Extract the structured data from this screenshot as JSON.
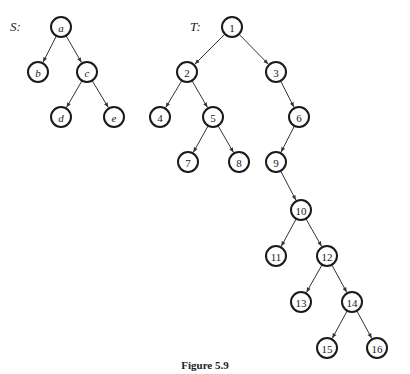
{
  "caption": "Figure 5.9",
  "trees": [
    {
      "id": "S",
      "label": "S:",
      "italic_nodes": true,
      "nodes": [
        "a",
        "b",
        "c",
        "d",
        "e"
      ],
      "edges": [
        [
          "a",
          "b"
        ],
        [
          "a",
          "c"
        ],
        [
          "c",
          "d"
        ],
        [
          "c",
          "e"
        ]
      ]
    },
    {
      "id": "T",
      "label": "T:",
      "italic_nodes": false,
      "nodes": [
        "1",
        "2",
        "3",
        "4",
        "5",
        "6",
        "7",
        "8",
        "9",
        "10",
        "11",
        "12",
        "13",
        "14",
        "15",
        "16"
      ],
      "edges": [
        [
          "1",
          "2"
        ],
        [
          "1",
          "3"
        ],
        [
          "2",
          "4"
        ],
        [
          "2",
          "5"
        ],
        [
          "5",
          "7"
        ],
        [
          "5",
          "8"
        ],
        [
          "3",
          "6"
        ],
        [
          "6",
          "9"
        ],
        [
          "9",
          "10"
        ],
        [
          "10",
          "11"
        ],
        [
          "10",
          "12"
        ],
        [
          "12",
          "13"
        ],
        [
          "12",
          "14"
        ],
        [
          "14",
          "15"
        ],
        [
          "14",
          "16"
        ]
      ]
    }
  ]
}
